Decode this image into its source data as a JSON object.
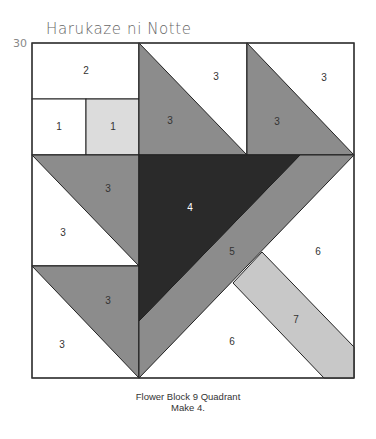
{
  "header": {
    "title": "Harukaze ni Notte",
    "page_number": "30"
  },
  "colors": {
    "white": "#ffffff",
    "light_gray": "#dcdcdc",
    "medium_gray": "#8c8c8c",
    "strip_gray": "#c8c8c8",
    "dark": "#2a2a2a",
    "outline": "#222222"
  },
  "diagram": {
    "labels": {
      "top_rect": "2",
      "small_white": "1",
      "small_light": "1",
      "hst_top_mid_white": "3",
      "hst_top_mid_gray": "3",
      "hst_top_right_white": "3",
      "hst_top_right_gray": "3",
      "hst_mid_left_gray": "3",
      "hst_mid_left_white": "3",
      "hst_bot_left_gray": "3",
      "hst_bot_left_white": "3",
      "center_dark": "4",
      "band": "5",
      "bg_right": "6",
      "bg_bottom": "6",
      "stem": "7"
    }
  },
  "caption": {
    "line1": "Flower Block 9 Quadrant",
    "line2": "Make 4."
  }
}
